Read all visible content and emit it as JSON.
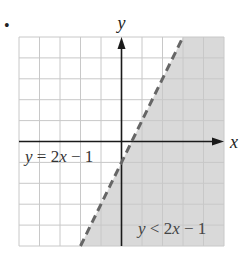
{
  "bullet": "•",
  "chart_data": {
    "type": "line",
    "title": "",
    "xlabel": "x",
    "ylabel": "y",
    "xlim": [
      -5,
      5
    ],
    "ylim": [
      -5,
      5
    ],
    "grid": true,
    "grid_step": 1,
    "series": [
      {
        "name": "y = 2x − 1",
        "kind": "boundary-line",
        "style": "dashed",
        "equation": {
          "slope": 2,
          "intercept": -1
        },
        "x": [
          -2,
          3
        ],
        "y": [
          -5,
          5
        ]
      }
    ],
    "shaded_region": {
      "inequality": "y < 2x − 1",
      "side": "below-right of line",
      "color": "#d9d9d9"
    },
    "annotations": [
      {
        "text_parts": [
          "y",
          " = 2",
          "x",
          " − 1"
        ],
        "label": "y = 2x − 1",
        "target": "boundary line"
      },
      {
        "text_parts": [
          "y",
          " < 2",
          "x",
          " − 1"
        ],
        "label": "y < 2x − 1",
        "target": "shaded region"
      }
    ]
  },
  "colors": {
    "grid": "#c8c8c8",
    "axis": "#1a1a1a",
    "boundary": "#666666",
    "shade": "#d9d9d9",
    "text": "#222222"
  }
}
